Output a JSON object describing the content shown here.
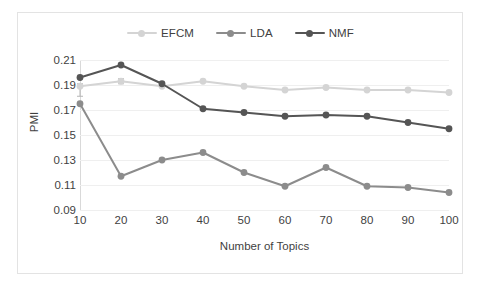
{
  "chart_data": {
    "type": "line",
    "title": "",
    "xlabel": "Number of Topics",
    "ylabel": "PMI",
    "categories": [
      10,
      20,
      30,
      40,
      50,
      60,
      70,
      80,
      90,
      100
    ],
    "x": [
      10,
      20,
      30,
      40,
      50,
      60,
      70,
      80,
      90,
      100
    ],
    "xtick_labels": [
      "10",
      "20",
      "30",
      "40",
      "50",
      "60",
      "70",
      "80",
      "90",
      "100"
    ],
    "ytick_labels": [
      "0.21",
      "0.19",
      "0.17",
      "0.15",
      "0.13",
      "0.11",
      "0.09"
    ],
    "ytick_values": [
      0.21,
      0.19,
      0.17,
      0.15,
      0.13,
      0.11,
      0.09
    ],
    "ylim": [
      0.09,
      0.21
    ],
    "xlim": [
      10,
      100
    ],
    "grid": true,
    "grid_axis": "y",
    "legend_position": "top-center",
    "marker": "circle",
    "series": [
      {
        "name": "EFCM",
        "color": "#d4d4d4",
        "values": [
          0.189,
          0.193,
          0.189,
          0.193,
          0.189,
          0.186,
          0.188,
          0.186,
          0.186,
          0.184
        ],
        "error_bars": [
          {
            "x": 10,
            "low": 0.181,
            "high": 0.191
          },
          {
            "x": 20,
            "low": 0.191,
            "high": 0.195
          }
        ]
      },
      {
        "name": "LDA",
        "color": "#8c8c8c",
        "values": [
          0.175,
          0.117,
          0.13,
          0.136,
          0.12,
          0.109,
          0.124,
          0.109,
          0.108,
          0.104
        ],
        "error_bars": []
      },
      {
        "name": "NMF",
        "color": "#555555",
        "values": [
          0.196,
          0.206,
          0.191,
          0.171,
          0.168,
          0.165,
          0.166,
          0.165,
          0.16,
          0.155
        ],
        "error_bars": []
      }
    ]
  },
  "legend": {
    "items": [
      {
        "label": "EFCM",
        "color": "#d4d4d4"
      },
      {
        "label": "LDA",
        "color": "#8c8c8c"
      },
      {
        "label": "NMF",
        "color": "#555555"
      }
    ]
  }
}
